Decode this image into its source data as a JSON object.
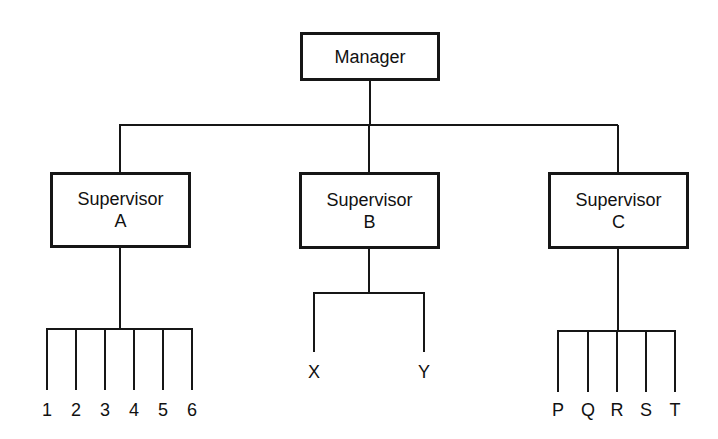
{
  "manager": {
    "label": "Manager"
  },
  "supervisors": [
    {
      "title": "Supervisor",
      "letter": "A",
      "reports": [
        "1",
        "2",
        "3",
        "4",
        "5",
        "6"
      ]
    },
    {
      "title": "Supervisor",
      "letter": "B",
      "reports": [
        "X",
        "Y"
      ]
    },
    {
      "title": "Supervisor",
      "letter": "C",
      "reports": [
        "P",
        "Q",
        "R",
        "S",
        "T"
      ]
    }
  ],
  "colors": {
    "line": "#161616",
    "background": "#ffffff"
  }
}
